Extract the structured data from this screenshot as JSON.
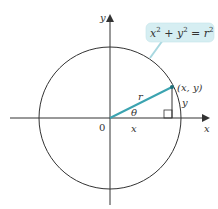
{
  "diagram": {
    "type": "unit-circle-polar",
    "colors": {
      "axis": "#333333",
      "circle": "#333333",
      "radius": "#3ba3b0",
      "callout_bg": "#d6eef2",
      "callout_border": "#a8d8e0"
    },
    "labels": {
      "y_axis": "y",
      "x_axis": "x",
      "origin": "0",
      "radius": "r",
      "angle": "θ",
      "x_leg": "x",
      "y_leg": "y",
      "point": "(x, y)",
      "equation_lhs_x": "x",
      "equation_exp1": "2",
      "equation_plus": " + y",
      "equation_exp2": "2",
      "equation_eq": " = r",
      "equation_exp3": "2"
    }
  }
}
